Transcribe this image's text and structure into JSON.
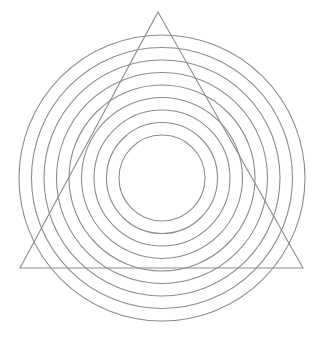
{
  "canvas": {
    "width": 323,
    "height": 352,
    "background_color": "#ffffff",
    "title": "Concentric circles with overlaid triangle"
  },
  "style": {
    "stroke_color": "#8c8c8c",
    "stroke_width": 1.1,
    "fill": "none",
    "line_join": "miter"
  },
  "chart_data": {
    "type": "scatter",
    "subtitle": "",
    "xlabel": "",
    "ylabel": "",
    "xlim": [
      0,
      323
    ],
    "ylim": [
      0,
      352
    ],
    "grid": false,
    "legend": "none",
    "annotations": [],
    "shapes": [
      {
        "name": "circle-1-innermost",
        "type": "circle",
        "cx": 162,
        "cy": 178,
        "r": 43,
        "stroke": "#8c8c8c",
        "fill": "none"
      },
      {
        "name": "circle-2",
        "type": "circle",
        "cx": 162,
        "cy": 178,
        "r": 55.5,
        "stroke": "#8c8c8c",
        "fill": "none"
      },
      {
        "name": "circle-3",
        "type": "circle",
        "cx": 162,
        "cy": 178,
        "r": 68,
        "stroke": "#8c8c8c",
        "fill": "none"
      },
      {
        "name": "circle-4",
        "type": "circle",
        "cx": 162,
        "cy": 178,
        "r": 80.5,
        "stroke": "#8c8c8c",
        "fill": "none"
      },
      {
        "name": "circle-5",
        "type": "circle",
        "cx": 162,
        "cy": 178,
        "r": 93,
        "stroke": "#8c8c8c",
        "fill": "none"
      },
      {
        "name": "circle-6",
        "type": "circle",
        "cx": 162,
        "cy": 178,
        "r": 105.5,
        "stroke": "#8c8c8c",
        "fill": "none"
      },
      {
        "name": "circle-7",
        "type": "circle",
        "cx": 162,
        "cy": 178,
        "r": 118,
        "stroke": "#8c8c8c",
        "fill": "none"
      },
      {
        "name": "circle-8",
        "type": "circle",
        "cx": 162,
        "cy": 178,
        "r": 130.5,
        "stroke": "#8c8c8c",
        "fill": "none"
      },
      {
        "name": "circle-9-outermost",
        "type": "circle",
        "cx": 162,
        "cy": 178,
        "r": 143,
        "stroke": "#8c8c8c",
        "fill": "none"
      },
      {
        "name": "triangle",
        "type": "polygon",
        "points": "158,12 303,268 20,268",
        "apex": [
          158,
          12
        ],
        "base_left": [
          20,
          268
        ],
        "base_right": [
          303,
          268
        ],
        "stroke": "#8c8c8c",
        "fill": "none"
      }
    ],
    "circle_count": 9,
    "circle_center": [
      162,
      178
    ],
    "circle_radii": [
      43,
      55.5,
      68,
      80.5,
      93,
      105.5,
      118,
      130.5,
      143
    ],
    "radius_step": 12.5
  }
}
